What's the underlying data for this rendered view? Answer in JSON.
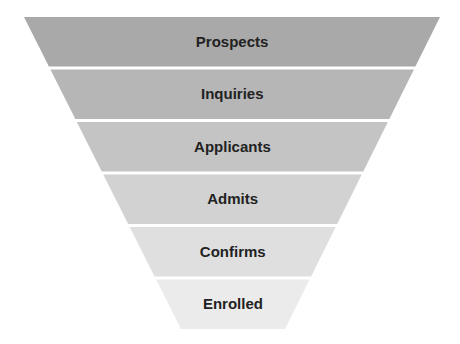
{
  "diagram": {
    "type": "funnel",
    "geometry": {
      "top_y": 17,
      "bottom_y": 329,
      "top_left_x": 24,
      "top_right_x": 440,
      "bottom_left_x": 181,
      "bottom_right_x": 285,
      "gap": 3
    },
    "stages": [
      {
        "label": "Prospects",
        "color": "#a9a9a9"
      },
      {
        "label": "Inquiries",
        "color": "#b6b6b6"
      },
      {
        "label": "Applicants",
        "color": "#c4c4c4"
      },
      {
        "label": "Admits",
        "color": "#d2d2d2"
      },
      {
        "label": "Confirms",
        "color": "#dfdfdf"
      },
      {
        "label": "Enrolled",
        "color": "#ebebeb"
      }
    ]
  }
}
